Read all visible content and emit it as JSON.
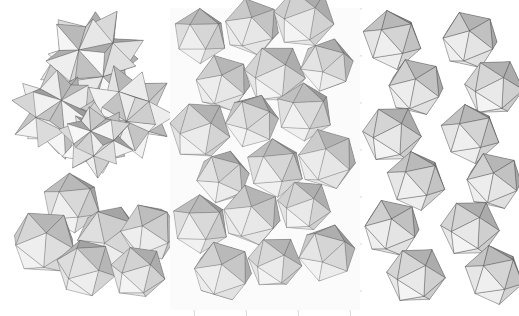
{
  "figure": {
    "background_color": "#ffffff",
    "width": 519,
    "height": 316,
    "panel_count": 3,
    "render_style": "flat-shaded grayscale polyhedra with thin dark edges",
    "labels": []
  },
  "palette": {
    "face_lightest": "#f2f2f2",
    "face_light": "#e2e2e2",
    "face_mid_light": "#d2d2d2",
    "face_mid": "#bfbfbf",
    "face_mid_dark": "#a9a9a9",
    "face_dark": "#969696",
    "face_darkest": "#858585",
    "face_ghost": "#ececec",
    "edge_color": "#3b3b3b",
    "edge_faint": "#c8c8c8",
    "cage_color": "#d8d8d8",
    "background": "#ffffff"
  },
  "panels": [
    {
      "id": "panel-a",
      "name": "left-panel",
      "description": "Two loose clusters of stellated and plain icosahedra",
      "groups": [
        {
          "id": "group-a-top",
          "name": "upper-stellated-cluster",
          "shape_type": "stellated-icosahedron",
          "count": 4,
          "centers": [
            [
              92,
              60
            ],
            [
              58,
              112
            ],
            [
              128,
              112
            ],
            [
              96,
              140
            ]
          ],
          "radii": [
            34,
            30,
            30,
            24
          ],
          "spike_ratio": 1.62
        },
        {
          "id": "group-a-bottom",
          "name": "lower-icosahedra-cluster",
          "shape_type": "icosahedron",
          "count": 6,
          "centers": [
            [
              72,
              203
            ],
            [
              44,
              242
            ],
            [
              110,
              238
            ],
            [
              150,
              232
            ],
            [
              86,
              268
            ],
            [
              138,
              272
            ]
          ],
          "radii": [
            30,
            34,
            34,
            30,
            30,
            28
          ]
        }
      ]
    },
    {
      "id": "panel-b",
      "name": "center-panel",
      "description": "Dense slab of interpenetrating icosahedra with faint cubic cage lines",
      "cage": {
        "visible": true,
        "line_color": "#d8d8d8",
        "columns": 3,
        "rows": 5
      },
      "lattice": {
        "shape_type": "icosahedron",
        "columns": 3,
        "rows": 6,
        "col_spacing": 52,
        "row_spacing": 47,
        "origin": [
          22,
          36
        ],
        "stagger": 23,
        "radius": 30,
        "count": 18
      }
    },
    {
      "id": "panel-c",
      "name": "right-panel",
      "description": "Open two-column lattice of discrete icosahedra joined vertex to vertex",
      "lattice": {
        "shape_type": "icosahedron",
        "columns": 2,
        "rows": 6,
        "col_spacing": 78,
        "row_spacing": 47,
        "origin": [
          44,
          40
        ],
        "stagger": 24,
        "radius": 30,
        "count": 12
      }
    }
  ],
  "shading": {
    "face_groups": [
      {
        "name": "top-left-facet",
        "color": "#ededed"
      },
      {
        "name": "top-right-facet",
        "color": "#dadada"
      },
      {
        "name": "upper-mid-facet",
        "color": "#c9c9c9"
      },
      {
        "name": "lower-mid-facet",
        "color": "#b0b0b0"
      },
      {
        "name": "bottom-left-facet",
        "color": "#9d9d9d"
      },
      {
        "name": "bottom-right-facet",
        "color": "#8d8d8d"
      }
    ]
  }
}
